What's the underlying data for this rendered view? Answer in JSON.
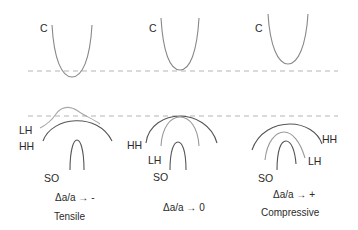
{
  "diagram": {
    "panels": [
      {
        "id": "tensile",
        "conduction_label": "C",
        "valence_labels": {
          "lh": "LH",
          "hh": "HH",
          "so": "SO"
        },
        "strain_label": "Δa/a → -",
        "caption": "Tensile"
      },
      {
        "id": "unstrained",
        "conduction_label": "C",
        "valence_labels": {
          "lh": "LH",
          "hh": "HH",
          "so": "SO"
        },
        "strain_label": "Δa/a → 0",
        "caption": ""
      },
      {
        "id": "compressive",
        "conduction_label": "C",
        "valence_labels": {
          "lh": "LH",
          "hh": "HH",
          "so": "SO"
        },
        "strain_label": "Δa/a → +",
        "caption": "Compressive"
      }
    ],
    "reference_lines": [
      "conduction-band-edge-unstrained",
      "valence-band-edge-unstrained"
    ],
    "colors": {
      "curve_dark": "#555555",
      "curve_light": "#9a9a9a",
      "dashed": "#b5b5b5"
    }
  }
}
